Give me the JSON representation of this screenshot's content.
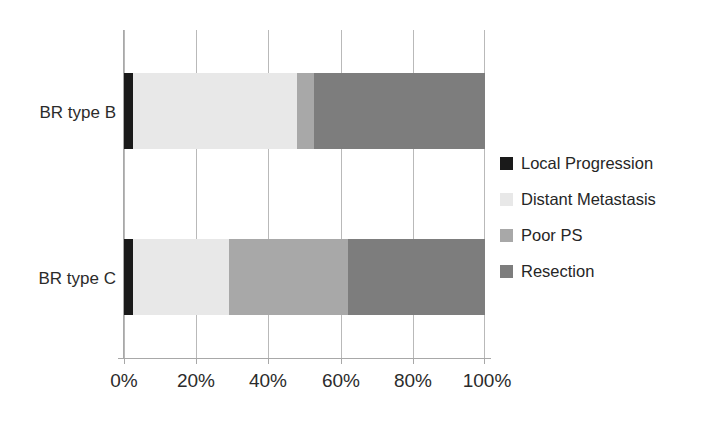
{
  "chart_data": {
    "type": "bar",
    "orientation": "horizontal",
    "stacked": true,
    "stack_mode": "percent",
    "title": "",
    "subtitle": "",
    "xlabel": "",
    "ylabel": "",
    "categories": [
      "BR type B",
      "BR type C"
    ],
    "xlim": [
      0,
      100
    ],
    "xticks": [
      0,
      20,
      40,
      60,
      80,
      100
    ],
    "xtick_labels": [
      "0%",
      "20%",
      "40%",
      "60%",
      "80%",
      "100%"
    ],
    "grid": true,
    "grid_axis": "x",
    "legend_position": "right",
    "series": [
      {
        "name": "Local Progression",
        "color": "#1a1a1a",
        "values": [
          2.5,
          2.5
        ]
      },
      {
        "name": "Distant Metastasis",
        "color": "#e8e8e8",
        "values": [
          45.5,
          26.6
        ]
      },
      {
        "name": "Poor PS",
        "color": "#a8a8a8",
        "values": [
          4.7,
          33.0
        ]
      },
      {
        "name": "Resection",
        "color": "#7d7d7d",
        "values": [
          47.3,
          37.9
        ]
      }
    ]
  },
  "axis": {
    "xtick_0": "0%",
    "xtick_1": "20%",
    "xtick_2": "40%",
    "xtick_3": "60%",
    "xtick_4": "80%",
    "xtick_5": "100%",
    "cat_0": "BR type B",
    "cat_1": "BR type C"
  },
  "legend": {
    "items": [
      {
        "label": "Local Progression",
        "color": "#1a1a1a"
      },
      {
        "label": "Distant Metastasis",
        "color": "#e8e8e8"
      },
      {
        "label": "Poor PS",
        "color": "#a8a8a8"
      },
      {
        "label": "Resection",
        "color": "#7d7d7d"
      }
    ]
  }
}
